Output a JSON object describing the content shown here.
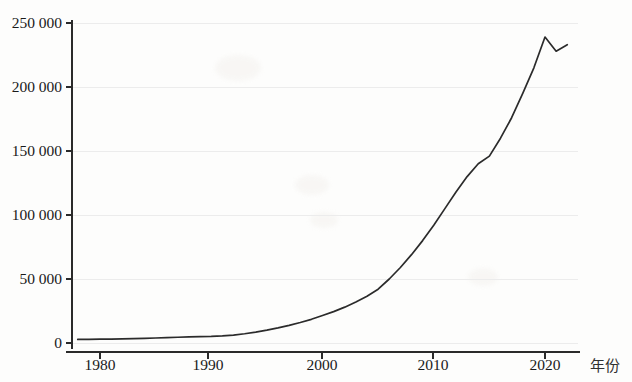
{
  "chart_data": {
    "type": "line",
    "title": "",
    "subtitle": "",
    "xlabel": "年份",
    "ylabel": "",
    "xlim": [
      1977,
      2023
    ],
    "ylim": [
      0,
      255000
    ],
    "grid": true,
    "legend": null,
    "xticks": [
      "1980",
      "1990",
      "2000",
      "2010",
      "2020"
    ],
    "xtick_values": [
      1980,
      1990,
      2000,
      2010,
      2020
    ],
    "yticks": [
      "0",
      "50 000",
      "100 000",
      "150 000",
      "200 000",
      "250 000"
    ],
    "ytick_values": [
      0,
      50000,
      100000,
      150000,
      200000,
      250000
    ],
    "line_color": "#2b2b2b",
    "series": [
      {
        "name": "",
        "x": [
          1978,
          1979,
          1980,
          1981,
          1982,
          1983,
          1984,
          1985,
          1986,
          1987,
          1988,
          1989,
          1990,
          1991,
          1992,
          1993,
          1994,
          1995,
          1996,
          1997,
          1998,
          1999,
          2000,
          2001,
          2002,
          2003,
          2004,
          2005,
          2006,
          2007,
          2008,
          2009,
          2010,
          2011,
          2012,
          2013,
          2014,
          2015,
          2016,
          2017,
          2018,
          2019,
          2020,
          2021,
          2022
        ],
        "values": [
          2800,
          2900,
          3000,
          3100,
          3200,
          3400,
          3600,
          3900,
          4200,
          4500,
          4800,
          5000,
          5200,
          5600,
          6200,
          7200,
          8500,
          10000,
          11800,
          13800,
          16000,
          18500,
          21500,
          24500,
          28000,
          32000,
          36500,
          42000,
          50000,
          59000,
          69000,
          80000,
          92000,
          105000,
          118000,
          130000,
          140000,
          146000,
          160000,
          176000,
          195000,
          215000,
          239000,
          228000,
          233000
        ]
      }
    ],
    "peak": {
      "year": 2020,
      "value": 239000
    },
    "dip": {
      "year": 2021,
      "value": 228000
    }
  },
  "axis": {
    "x_title": "年份"
  }
}
